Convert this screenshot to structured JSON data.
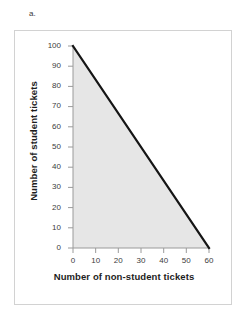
{
  "part_label": "a.",
  "chart_data": {
    "type": "area",
    "title": "",
    "subtitle": "",
    "xlabel": "Number of non-student tickets",
    "ylabel": "Number of student tickets",
    "xlim": [
      0,
      60
    ],
    "ylim": [
      0,
      100
    ],
    "xticks": [
      0,
      10,
      20,
      30,
      40,
      50,
      60
    ],
    "yticks": [
      0,
      10,
      20,
      30,
      40,
      50,
      60,
      70,
      80,
      90,
      100
    ],
    "grid": false,
    "legend": "none",
    "series": [
      {
        "name": "constraint boundary",
        "x": [
          0,
          60
        ],
        "values": [
          100,
          0
        ],
        "line_color": "#151515",
        "line_width": 2,
        "fill": "below",
        "fill_color": "#e6e6e6"
      }
    ],
    "annotations": []
  },
  "colors": {
    "line": "#151515",
    "fill": "#e6e6e6",
    "axis": "#9a9a9a",
    "frame": "#d2d2d2",
    "text": "#1d1d1d",
    "tick_text": "#3c3c3c"
  }
}
